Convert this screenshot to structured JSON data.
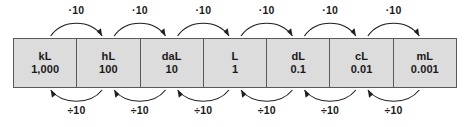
{
  "diagram": {
    "type": "metric-unit-conversion-chart",
    "base_unit": "L",
    "colors": {
      "cell_fill": "#dcdcdc",
      "border": "#58595b",
      "arrow": "#231f20",
      "text": "#1a1a1a",
      "background": "#ffffff"
    },
    "units": [
      {
        "symbol": "kL",
        "value": "1,000"
      },
      {
        "symbol": "hL",
        "value": "100"
      },
      {
        "symbol": "daL",
        "value": "10"
      },
      {
        "symbol": "L",
        "value": "1"
      },
      {
        "symbol": "dL",
        "value": "0.1"
      },
      {
        "symbol": "cL",
        "value": "0.01"
      },
      {
        "symbol": "mL",
        "value": "0.001"
      }
    ],
    "top_arrows": {
      "direction": "left-to-right",
      "labels": [
        "·10",
        "·10",
        "·10",
        "·10",
        "·10",
        "·10"
      ]
    },
    "bottom_arrows": {
      "direction": "right-to-left",
      "labels": [
        "÷10",
        "÷10",
        "÷10",
        "÷10",
        "÷10",
        "÷10"
      ]
    }
  }
}
